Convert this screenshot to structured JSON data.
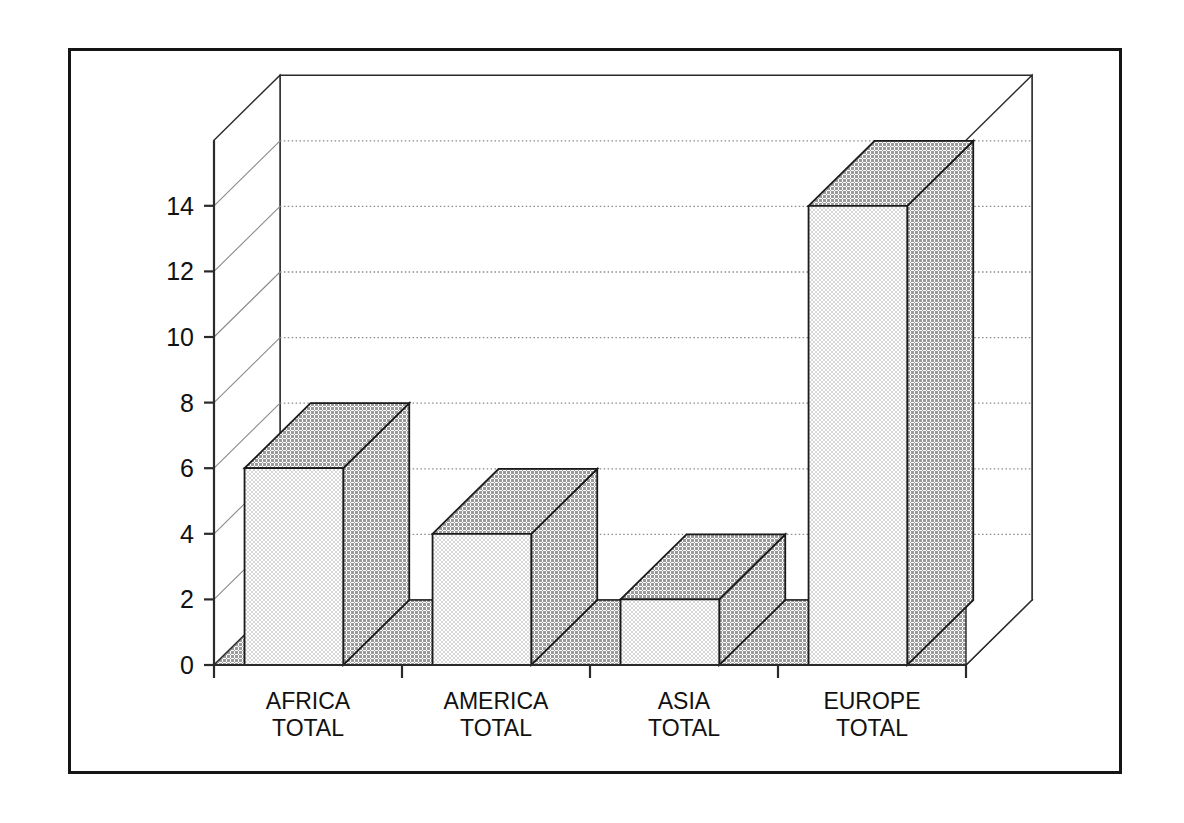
{
  "figure": {
    "border_color": "#151515",
    "background": "#ffffff"
  },
  "chart_data": {
    "type": "bar",
    "style": "3d-column",
    "title": "Adventure, multi-aventure in:",
    "subtitle": "",
    "xlabel": "",
    "ylabel": "",
    "categories": [
      "AFRICA TOTAL",
      "AMERICA TOTAL",
      "ASIA TOTAL",
      "EUROPE TOTAL"
    ],
    "category_lines": [
      [
        "AFRICA",
        "TOTAL"
      ],
      [
        "AMERICA",
        "TOTAL"
      ],
      [
        "ASIA",
        "TOTAL"
      ],
      [
        "EUROPE",
        "TOTAL"
      ]
    ],
    "values": [
      6,
      4,
      2,
      14
    ],
    "ylim": [
      0,
      16
    ],
    "yticks": [
      0,
      2,
      4,
      6,
      8,
      10,
      12,
      14
    ],
    "ytick_labels": [
      "0",
      "2",
      "4",
      "6",
      "8",
      "10",
      "12",
      "14"
    ],
    "grid": true,
    "grid_style": "dotted",
    "legend": "none",
    "colors": {
      "bar_front": "#e9e9e9",
      "bar_side": "#b6b6b6",
      "bar_top": "#b6b6b6",
      "outline": "#1a1a1a",
      "floor": "#b6b6b6",
      "wall": "#ffffff",
      "grid": "#8a8a8a",
      "axis": "#2a2a2a"
    }
  }
}
